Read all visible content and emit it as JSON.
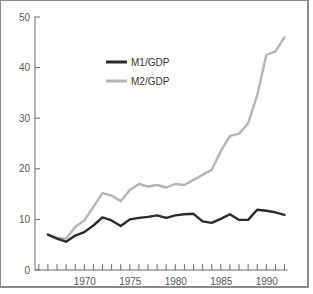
{
  "chart_data": {
    "type": "line",
    "title": "",
    "xlabel": "",
    "ylabel": "",
    "x": [
      1966,
      1967,
      1968,
      1969,
      1970,
      1971,
      1972,
      1973,
      1974,
      1975,
      1976,
      1977,
      1978,
      1979,
      1980,
      1981,
      1982,
      1983,
      1984,
      1985,
      1986,
      1987,
      1988,
      1989,
      1990,
      1991,
      1992
    ],
    "series": [
      {
        "name": "M1/GDP",
        "color": "#2a2a2a",
        "values": [
          7.0,
          6.2,
          5.6,
          6.8,
          7.5,
          8.8,
          10.4,
          9.8,
          8.7,
          10.0,
          10.3,
          10.5,
          10.8,
          10.3,
          10.8,
          11.0,
          11.1,
          9.6,
          9.3,
          10.1,
          11.0,
          9.9,
          9.9,
          11.9,
          11.7,
          11.4,
          10.9
        ]
      },
      {
        "name": "M2/GDP",
        "color": "#b4b4b4",
        "values": [
          7.0,
          6.4,
          6.2,
          8.5,
          9.8,
          12.5,
          15.2,
          14.7,
          13.6,
          15.8,
          17.0,
          16.5,
          16.8,
          16.3,
          17.0,
          16.8,
          17.8,
          18.8,
          19.8,
          23.5,
          26.5,
          26.9,
          29.0,
          34.5,
          42.5,
          43.2,
          46.0
        ]
      }
    ],
    "ylim": [
      0,
      50
    ],
    "xlim": [
      1965,
      1992
    ],
    "y_ticks": [
      0,
      10,
      20,
      30,
      40,
      50
    ],
    "y_tick_labels": [
      "0",
      "10",
      "20",
      "30",
      "40",
      "50"
    ],
    "x_minor_ticks_every": 1,
    "x_tick_labels": [
      {
        "value": 1970,
        "label": "1970"
      },
      {
        "value": 1975,
        "label": "1975"
      },
      {
        "value": 1980,
        "label": "1980"
      },
      {
        "value": 1985,
        "label": "1985"
      },
      {
        "value": 1990,
        "label": "1990"
      }
    ],
    "grid": false,
    "legend_position": "upper-middle-left"
  }
}
